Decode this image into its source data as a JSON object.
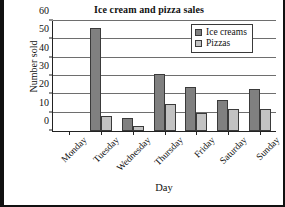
{
  "chart_data": {
    "type": "bar",
    "title": "Ice cream and pizza sales",
    "xlabel": "Day",
    "ylabel": "Number sold",
    "categories": [
      "Monday",
      "Tuesday",
      "Wednesday",
      "Thursday",
      "Friday",
      "Saturday",
      "Sunday"
    ],
    "series": [
      {
        "name": "Ice creams",
        "color": "#808080",
        "values": [
          0,
          56,
          7,
          31,
          24,
          17,
          23
        ]
      },
      {
        "name": "Pizzas",
        "color": "#c2c2c2",
        "values": [
          0,
          8,
          3,
          15,
          10,
          12,
          12
        ]
      }
    ],
    "ylim": [
      0,
      60
    ],
    "yticks": [
      0,
      10,
      20,
      30,
      40,
      50,
      60
    ],
    "ytick_labels": [
      "0",
      "10",
      "20",
      "30",
      "40",
      "50",
      "60"
    ],
    "grid": true,
    "legend_position": "top-right"
  }
}
